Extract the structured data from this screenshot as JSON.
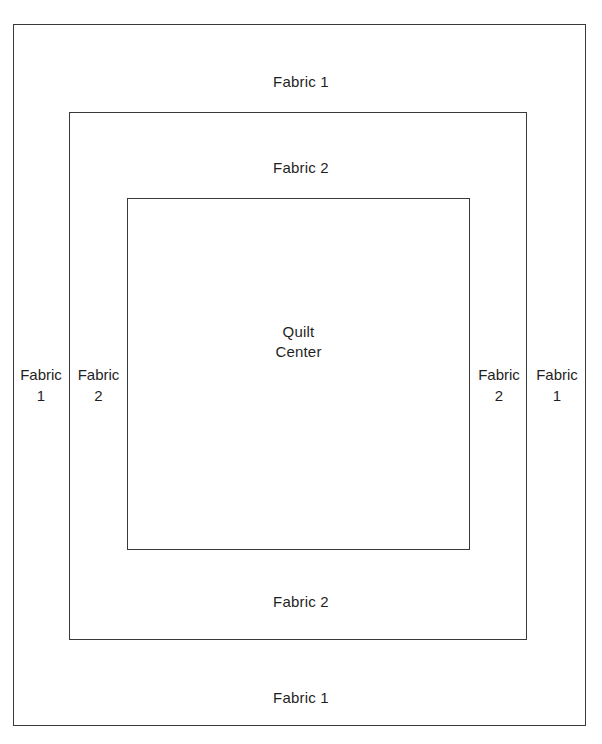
{
  "diagram": {
    "line_color": "#3a3a3a",
    "background_color": "#ffffff",
    "regions": {
      "outer_border": "Fabric 1",
      "inner_border": "Fabric 2",
      "center": "Quilt Center"
    }
  },
  "labels": {
    "top_outer": "Fabric 1",
    "top_inner": "Fabric 2",
    "center": "Quilt\nCenter",
    "bottom_inner": "Fabric 2",
    "bottom_outer": "Fabric 1",
    "left_outer": "Fabric\n1",
    "left_inner": "Fabric\n2",
    "right_inner": "Fabric\n2",
    "right_outer": "Fabric\n1"
  }
}
